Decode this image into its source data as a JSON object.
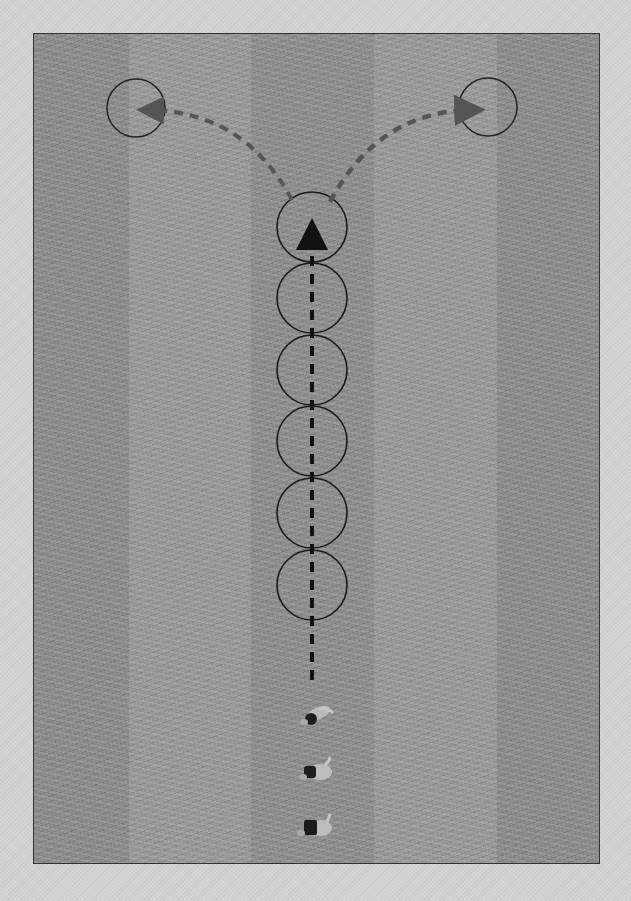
{
  "diagram": {
    "type": "drill-diagram",
    "field": {
      "x": 33,
      "y": 33,
      "width": 567,
      "height": 831,
      "base_color": "#8f8f8f",
      "border_color": "#333333",
      "stripes": [
        {
          "x": 0,
          "width": 95,
          "color": "#8a8a8a"
        },
        {
          "x": 95,
          "width": 122,
          "color": "#959595"
        },
        {
          "x": 217,
          "width": 123,
          "color": "#8c8c8c"
        },
        {
          "x": 340,
          "width": 123,
          "color": "#959595"
        },
        {
          "x": 463,
          "width": 104,
          "color": "#8a8a8a"
        }
      ]
    },
    "page_background": "#d3d3d3",
    "cones_column": {
      "center_x": 312,
      "radius": 35,
      "centers_y": [
        227,
        298,
        370,
        441,
        513,
        585
      ],
      "stroke": "#1a1a1a"
    },
    "target_circles": [
      {
        "name": "left-target",
        "cx": 136,
        "cy": 108,
        "r": 29
      },
      {
        "name": "right-target",
        "cx": 488,
        "cy": 107,
        "r": 29
      }
    ],
    "paths": {
      "forward_run": {
        "from": [
          312,
          680
        ],
        "to": [
          312,
          218
        ],
        "color": "#111111",
        "dash": "10,8",
        "width": 4
      },
      "left_branch": {
        "d": "M292 200 Q 240 110 140 110",
        "color": "#555555",
        "dash": "9,7",
        "width": 4
      },
      "right_branch": {
        "d": "M330 202 Q 380 110 484 110",
        "color": "#555555",
        "dash": "9,7",
        "width": 4.5
      }
    },
    "players": [
      {
        "name": "player-1",
        "x": 313,
        "y": 717
      },
      {
        "name": "player-2",
        "x": 313,
        "y": 772
      },
      {
        "name": "player-3",
        "x": 313,
        "y": 828
      }
    ]
  }
}
